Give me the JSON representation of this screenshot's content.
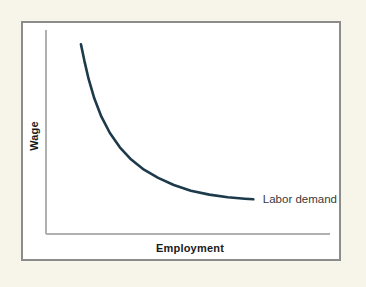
{
  "figure": {
    "background_color": "#f7f5e9",
    "panel_color": "#ffffff",
    "panel_border_color": "#8c8c8c"
  },
  "chart_data": {
    "type": "line",
    "title": "",
    "subtitle": "",
    "xlabel": "Employment",
    "ylabel": "Wage",
    "grid": false,
    "legend_position": "inline-right-of-curve",
    "axis_color": "#b0b0b0",
    "xlim": [
      0,
      100
    ],
    "ylim": [
      0,
      100
    ],
    "x_ticks": [],
    "y_ticks": [],
    "x_tick_labels": [],
    "y_tick_labels": [],
    "annotations": [
      {
        "name": "labor-demand-label",
        "text": "Labor demand",
        "x": 76,
        "y": 17
      }
    ],
    "series": [
      {
        "name": "Labor demand",
        "color": "#1d3a4a",
        "line_width": 2.6,
        "x": [
          12.3,
          13.5,
          15.0,
          17.0,
          19.5,
          22.5,
          26.0,
          30.0,
          34.5,
          39.5,
          45.0,
          51.0,
          57.5,
          64.0,
          70.0,
          73.0
        ],
        "y": [
          93.0,
          85.0,
          76.0,
          66.5,
          57.5,
          49.5,
          42.5,
          36.5,
          31.5,
          27.5,
          24.0,
          21.2,
          19.3,
          18.0,
          17.3,
          17.0
        ]
      }
    ]
  },
  "labels": {
    "y_axis": "Wage",
    "x_axis": "Employment",
    "series_1": "Labor demand"
  }
}
